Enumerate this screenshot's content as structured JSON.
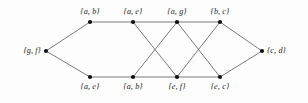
{
  "figure": {
    "background_color": "#fdfdfd",
    "edge_color": "#6b6b6b",
    "node_color": "#111111",
    "label_color": "#1a1a1a"
  },
  "nodes": [
    {
      "id": "left",
      "label": "{g, f}",
      "x": 46,
      "y": 51,
      "label_pos": "left"
    },
    {
      "id": "t1",
      "label": "{a, b}",
      "x": 90,
      "y": 22,
      "label_pos": "top"
    },
    {
      "id": "t2",
      "label": "{a, e}",
      "x": 133,
      "y": 22,
      "label_pos": "top"
    },
    {
      "id": "t3",
      "label": "{a, g}",
      "x": 177,
      "y": 22,
      "label_pos": "top"
    },
    {
      "id": "t4",
      "label": "{b, c}",
      "x": 220,
      "y": 22,
      "label_pos": "top"
    },
    {
      "id": "b1",
      "label": "{a, e}",
      "x": 90,
      "y": 77,
      "label_pos": "bottom"
    },
    {
      "id": "b2",
      "label": "{a, b}",
      "x": 133,
      "y": 77,
      "label_pos": "bottom"
    },
    {
      "id": "b3",
      "label": "{e, f}",
      "x": 177,
      "y": 77,
      "label_pos": "bottom"
    },
    {
      "id": "b4",
      "label": "{e, c}",
      "x": 220,
      "y": 77,
      "label_pos": "bottom"
    },
    {
      "id": "right",
      "label": "{c, d}",
      "x": 262,
      "y": 51,
      "label_pos": "right"
    }
  ],
  "edges": [
    {
      "from": "left",
      "to": "t1"
    },
    {
      "from": "left",
      "to": "b1"
    },
    {
      "from": "t1",
      "to": "t2"
    },
    {
      "from": "t2",
      "to": "t3"
    },
    {
      "from": "t3",
      "to": "t4"
    },
    {
      "from": "b1",
      "to": "b2"
    },
    {
      "from": "b2",
      "to": "b3"
    },
    {
      "from": "b3",
      "to": "b4"
    },
    {
      "from": "t2",
      "to": "b3"
    },
    {
      "from": "t3",
      "to": "b2"
    },
    {
      "from": "t3",
      "to": "b4"
    },
    {
      "from": "t4",
      "to": "b3"
    },
    {
      "from": "t4",
      "to": "right"
    },
    {
      "from": "b4",
      "to": "right"
    }
  ]
}
